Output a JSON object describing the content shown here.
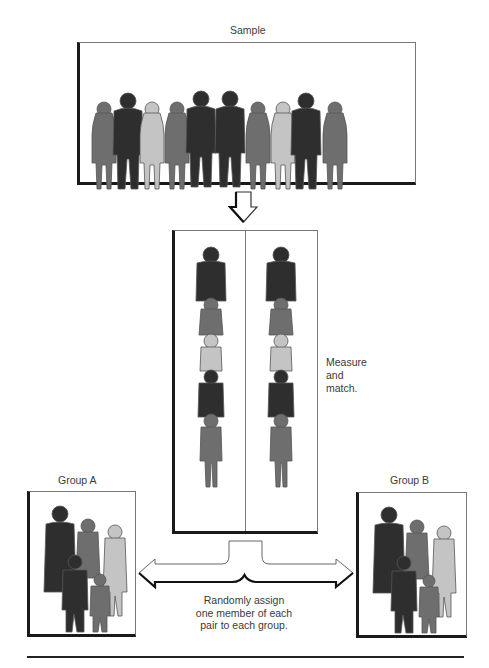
{
  "sample": {
    "title": "Sample"
  },
  "pairs": {
    "annotation_line1": "Measure",
    "annotation_line2": "and",
    "annotation_line3": "match."
  },
  "group_a": {
    "title": "Group A"
  },
  "group_b": {
    "title": "Group B"
  },
  "caption": {
    "line1": "Randomly assign",
    "line2": "one member of each",
    "line3": "pair to each group."
  },
  "colors": {
    "dark": "#2e2e2e",
    "medium": "#6e6e6e",
    "light": "#c4c4c4",
    "outline": "#555555"
  }
}
